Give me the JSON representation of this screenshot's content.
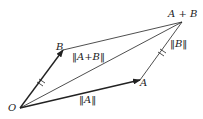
{
  "diagram": {
    "type": "vector-parallelogram",
    "points": {
      "O": {
        "label": "O",
        "x": 20,
        "y": 108
      },
      "A": {
        "label": "A",
        "x": 140,
        "y": 80
      },
      "B": {
        "label": "B",
        "x": 63,
        "y": 50
      },
      "A_plus_B": {
        "label": "A + B",
        "x": 182,
        "y": 22
      }
    },
    "labels": {
      "norm_A": "‖A‖",
      "norm_B": "‖B‖",
      "norm_A_plus_B": "‖A+B‖"
    },
    "colors": {
      "stroke": "#222222",
      "background": "#ffffff"
    }
  }
}
